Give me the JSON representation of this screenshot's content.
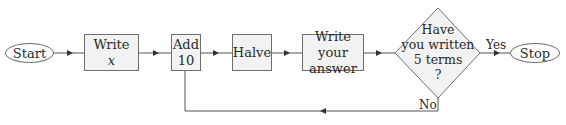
{
  "flowchart": {
    "nodes": {
      "start": {
        "label": "Start",
        "shape": "oval"
      },
      "write_x": {
        "line1": "Write",
        "line2": "x",
        "shape": "rectangle"
      },
      "add_10": {
        "line1": "Add",
        "line2": "10",
        "shape": "rectangle"
      },
      "halve": {
        "label": "Halve",
        "shape": "rectangle"
      },
      "write_answer": {
        "line1": "Write your",
        "line2": "answer",
        "shape": "rectangle"
      },
      "decision": {
        "line1": "Have",
        "line2": "you written",
        "line3": "5 terms",
        "line4": "?",
        "shape": "diamond"
      },
      "stop": {
        "label": "Stop",
        "shape": "oval"
      }
    },
    "edge_labels": {
      "yes": "Yes",
      "no": "No"
    },
    "edges": [
      {
        "from": "start",
        "to": "write_x"
      },
      {
        "from": "write_x",
        "to": "add_10"
      },
      {
        "from": "add_10",
        "to": "halve"
      },
      {
        "from": "halve",
        "to": "write_answer"
      },
      {
        "from": "write_answer",
        "to": "decision"
      },
      {
        "from": "decision",
        "to": "stop",
        "label": "Yes"
      },
      {
        "from": "decision",
        "to": "add_10",
        "label": "No"
      }
    ]
  },
  "colors": {
    "line": "#555555",
    "box_fill": "#f2f2f2",
    "border": "#6e6e6e"
  }
}
